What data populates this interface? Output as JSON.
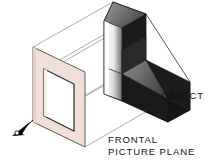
{
  "figure": {
    "background_color": "#ffffff",
    "labels": {
      "object": "OBJECT",
      "plane_line1": "FRONTAL",
      "plane_line2": "PICTURE PLANE"
    },
    "colors": {
      "picture_plane_fill": "#f2ded9",
      "picture_plane_edge": "#4a4a4a",
      "projection_line": "#6e6e6e",
      "object_dark_face": "#1a1a1a",
      "object_top_face_light": "#8e8e8e",
      "object_top_face_dark": "#4f4f4f",
      "object_front_face_light": "#ffffff",
      "object_front_face_dark": "#787878",
      "arrow_fill": "#000000",
      "text_color": "#111111"
    },
    "elements": {
      "arrow": "viewer-eye-arrow",
      "picture_plane": "frontal-picture-plane-parallelogram",
      "aperture": "picture-plane-inner-opening",
      "object": "l-shaped-step-block",
      "projection_lines_count": 6
    }
  }
}
